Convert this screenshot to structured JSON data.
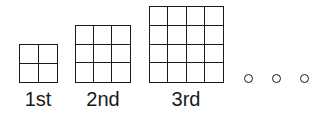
{
  "figures": [
    {
      "label": "1st",
      "n": 2
    },
    {
      "label": "2nd",
      "n": 3
    },
    {
      "label": "3rd",
      "n": 4
    }
  ],
  "continuation": "o o o",
  "colors": {
    "line": "#1a1a1a",
    "background": "#ffffff"
  }
}
